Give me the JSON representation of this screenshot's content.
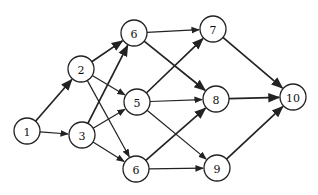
{
  "diagram": {
    "type": "directed-graph",
    "nodes": [
      {
        "id": "n1",
        "label": "1",
        "x": 27,
        "y": 131
      },
      {
        "id": "n2",
        "label": "2",
        "x": 81,
        "y": 69
      },
      {
        "id": "n3",
        "label": "3",
        "x": 82,
        "y": 135
      },
      {
        "id": "n6a",
        "label": "6",
        "x": 134,
        "y": 33
      },
      {
        "id": "n5",
        "label": "5",
        "x": 137,
        "y": 102
      },
      {
        "id": "n6b",
        "label": "6",
        "x": 136,
        "y": 169
      },
      {
        "id": "n7",
        "label": "7",
        "x": 213,
        "y": 29
      },
      {
        "id": "n8",
        "label": "8",
        "x": 216,
        "y": 99
      },
      {
        "id": "n9",
        "label": "9",
        "x": 217,
        "y": 168
      },
      {
        "id": "n10",
        "label": "10",
        "x": 293,
        "y": 97
      }
    ],
    "edges": [
      {
        "from": "n1",
        "to": "n2",
        "bold": true
      },
      {
        "from": "n1",
        "to": "n3",
        "bold": false
      },
      {
        "from": "n2",
        "to": "n6a",
        "bold": true
      },
      {
        "from": "n2",
        "to": "n5",
        "bold": false
      },
      {
        "from": "n2",
        "to": "n6b",
        "bold": false
      },
      {
        "from": "n3",
        "to": "n6a",
        "bold": true
      },
      {
        "from": "n3",
        "to": "n5",
        "bold": false
      },
      {
        "from": "n3",
        "to": "n6b",
        "bold": false
      },
      {
        "from": "n6a",
        "to": "n7",
        "bold": false
      },
      {
        "from": "n6a",
        "to": "n8",
        "bold": true
      },
      {
        "from": "n5",
        "to": "n7",
        "bold": true
      },
      {
        "from": "n5",
        "to": "n8",
        "bold": false
      },
      {
        "from": "n5",
        "to": "n9",
        "bold": false
      },
      {
        "from": "n6b",
        "to": "n8",
        "bold": true
      },
      {
        "from": "n6b",
        "to": "n9",
        "bold": false
      },
      {
        "from": "n7",
        "to": "n10",
        "bold": true
      },
      {
        "from": "n8",
        "to": "n10",
        "bold": true
      },
      {
        "from": "n9",
        "to": "n10",
        "bold": true
      }
    ],
    "node_radius": 13,
    "colors": {
      "stroke": "#222222",
      "fill": "#ffffff",
      "text": "#111111"
    }
  }
}
